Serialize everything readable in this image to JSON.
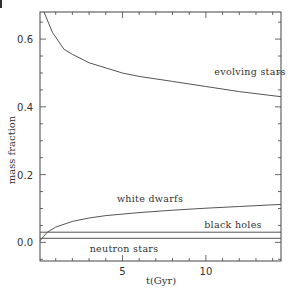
{
  "chart_data": {
    "type": "line",
    "title": "",
    "xlabel": "t(Gyr)",
    "ylabel": "mass fraction",
    "xlim": [
      0.06,
      14.5
    ],
    "ylim": [
      -0.055,
      0.68
    ],
    "grid": false,
    "legend": "inline labels",
    "x_ticks": [
      5,
      10
    ],
    "y_ticks": [
      0.0,
      0.2,
      0.4,
      0.6
    ],
    "x_tick_labels": [
      "5",
      "10"
    ],
    "y_tick_labels": [
      "0.0",
      "0.2",
      "0.4",
      "0.6"
    ],
    "series": [
      {
        "name": "evolving stars",
        "x": [
          0.3,
          0.8,
          1.5,
          2.0,
          3.0,
          4.0,
          5.0,
          6.0,
          8.0,
          10.0,
          12.0,
          14.5
        ],
        "values": [
          0.68,
          0.62,
          0.57,
          0.555,
          0.53,
          0.515,
          0.5,
          0.49,
          0.475,
          0.46,
          0.445,
          0.43
        ]
      },
      {
        "name": "white dwarfs",
        "x": [
          0.06,
          0.5,
          1.0,
          2.0,
          3.0,
          4.0,
          6.0,
          8.0,
          10.0,
          12.0,
          14.5
        ],
        "values": [
          0.005,
          0.03,
          0.045,
          0.062,
          0.072,
          0.079,
          0.088,
          0.095,
          0.101,
          0.106,
          0.112
        ]
      },
      {
        "name": "black holes",
        "x": [
          0.06,
          14.5
        ],
        "values": [
          0.03,
          0.03
        ]
      },
      {
        "name": "neutron stars",
        "x": [
          0.06,
          14.5
        ],
        "values": [
          0.012,
          0.012
        ]
      }
    ],
    "annotations": [
      {
        "text": "evolving stars",
        "x": 10.6,
        "y": 0.51
      },
      {
        "text": "white dwarfs",
        "x": 4.0,
        "y": 0.135
      },
      {
        "text": "black holes",
        "x": 11.3,
        "y": 0.055
      },
      {
        "text": "neutron stars",
        "x": 4.3,
        "y": -0.03
      }
    ]
  },
  "labels": {
    "xlabel": "t(Gyr)",
    "ylabel": "mass fraction",
    "evolving": "evolving stars",
    "white": "white dwarfs",
    "black": "black holes",
    "neutron": "neutron stars"
  }
}
